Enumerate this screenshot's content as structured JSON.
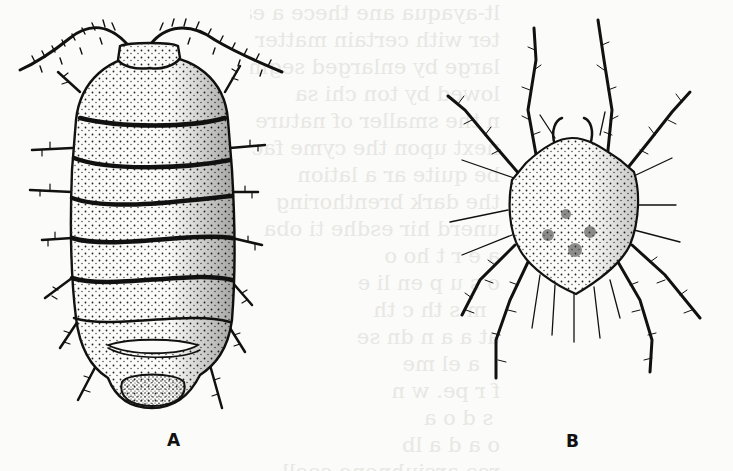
{
  "figure": {
    "panels": [
      {
        "id": "A",
        "label": "A",
        "subject": "isopod (pill bug / woodlouse), dorsal view",
        "segments": 7
      },
      {
        "id": "B",
        "label": "B",
        "subject": "mite, dorsal view",
        "legs": 8
      }
    ],
    "colors": {
      "ink": "#111111",
      "paper": "#fbfbf9",
      "bleed_through": "#d8d8d4"
    }
  },
  "bleed_through_text": "lt-ayaqua ane thece a ea\nter with certain matter ch\nlarge by enlarged segmen\nlowed by ton chi sa\nn the smaller of nature hav\nnext upon the cyme fact\nbe quite ar a lation\nthe dark brenthoring\nunerd hir esdhe ti oba\na e r t ho o\no s u p en li e\n  m s th c th\nat a a n dn se\n   a el me\nf r pe. w n\n s d o a\no a d a lb\nrce arciuhnene cooll\nbe pae th peetheso il ibod"
}
